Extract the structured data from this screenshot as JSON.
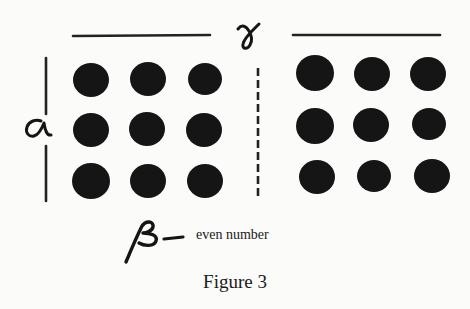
{
  "diagram": {
    "caption": "Figure 3",
    "labels": {
      "top": "γ",
      "left": "α",
      "bottom": "β",
      "bottom_note": "even number"
    },
    "left_grid": {
      "rows": 3,
      "cols": 3,
      "dots": [
        {
          "cx": 91,
          "cy": 80,
          "r": 17
        },
        {
          "cx": 148,
          "cy": 79,
          "r": 17
        },
        {
          "cx": 205,
          "cy": 79,
          "r": 16
        },
        {
          "cx": 91,
          "cy": 130,
          "r": 17
        },
        {
          "cx": 147,
          "cy": 129,
          "r": 17
        },
        {
          "cx": 204,
          "cy": 130,
          "r": 17
        },
        {
          "cx": 91,
          "cy": 181,
          "r": 18
        },
        {
          "cx": 148,
          "cy": 181,
          "r": 17
        },
        {
          "cx": 205,
          "cy": 181,
          "r": 17
        }
      ]
    },
    "right_grid": {
      "rows": 3,
      "cols": 3,
      "dots": [
        {
          "cx": 315,
          "cy": 73,
          "r": 18
        },
        {
          "cx": 372,
          "cy": 74,
          "r": 17
        },
        {
          "cx": 428,
          "cy": 74,
          "r": 17
        },
        {
          "cx": 315,
          "cy": 126,
          "r": 18
        },
        {
          "cx": 371,
          "cy": 125,
          "r": 17
        },
        {
          "cx": 429,
          "cy": 124,
          "r": 16
        },
        {
          "cx": 317,
          "cy": 177,
          "r": 17
        },
        {
          "cx": 374,
          "cy": 176,
          "r": 16
        },
        {
          "cx": 432,
          "cy": 176,
          "r": 17
        }
      ]
    },
    "colors": {
      "ink": "#151515",
      "background": "#fbfbfa"
    }
  }
}
